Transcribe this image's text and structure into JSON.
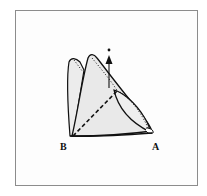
{
  "diagram": {
    "type": "folding-illustration",
    "labels": {
      "corner_b": "B",
      "corner_a": "A"
    },
    "elements": [
      "folded-flap-left",
      "folded-flap-middle",
      "front-triangle",
      "lens-curve-with-dotted-edge",
      "dashed-fold-line-from-B",
      "upward-arrow-with-dot"
    ],
    "colors": {
      "fill": "#ebebeb",
      "stroke": "#111111",
      "frame": "#8c8c8c",
      "background": "#ffffff"
    }
  }
}
